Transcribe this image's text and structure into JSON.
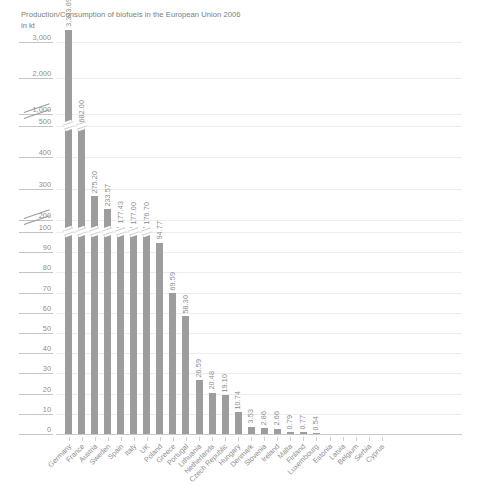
{
  "chart_data": {
    "type": "bar",
    "title": "Production/Consumption of biofuels in the European Union 2006",
    "subtitle": "in kt",
    "xlabel": "",
    "ylabel": "in kt",
    "grid": true,
    "legend": false,
    "axis_breaks": [
      {
        "between": [
          1000,
          500
        ],
        "label": "axis-break-upper"
      },
      {
        "between": [
          200,
          100
        ],
        "label": "axis-break-lower"
      }
    ],
    "ytick_labels": [
      "3,000",
      "2,000",
      "1,000",
      "500",
      "400",
      "300",
      "200",
      "100",
      "90",
      "80",
      "70",
      "60",
      "50",
      "40",
      "30",
      "20",
      "10",
      "0"
    ],
    "yticks": [
      3000,
      2000,
      1000,
      500,
      400,
      300,
      200,
      100,
      90,
      80,
      70,
      60,
      50,
      40,
      30,
      20,
      10,
      0
    ],
    "ylim": [
      0,
      3500
    ],
    "categories": [
      "Germany",
      "France",
      "Austria",
      "Sweden",
      "Spain",
      "Italy",
      "UK",
      "Poland",
      "Greece",
      "Portugal",
      "Lithuania",
      "Netherlands",
      "Czech Republic",
      "Hungary",
      "Denmark",
      "Slovenia",
      "Ireland",
      "Malta",
      "Finland",
      "Luxembourg",
      "Estonia",
      "Latvia",
      "Belgium",
      "Serbia",
      "Cyprus"
    ],
    "values": [
      3343.69,
      682.0,
      275.2,
      233.57,
      177.43,
      177.0,
      176.7,
      94.77,
      69.59,
      58.3,
      26.59,
      20.48,
      19.1,
      10.74,
      3.53,
      2.86,
      2.66,
      0.79,
      0.77,
      0.54,
      0,
      0,
      0,
      0,
      0
    ],
    "value_labels": [
      "3,343.69",
      "682.00",
      "275.20",
      "233.57",
      "177.43",
      "177.00",
      "176.70",
      "94.77",
      "69.59",
      "58.30",
      "26.59",
      "20.48",
      "19.10",
      "10.74",
      "3.53",
      "2.86",
      "2.66",
      "0.79",
      "0.77",
      "0.54",
      "",
      "",
      "",
      "",
      ""
    ],
    "bar_color": "#9d9d9d",
    "grid_color": "#ededed",
    "text_color": "#8d8d8d"
  }
}
